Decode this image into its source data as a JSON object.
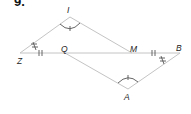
{
  "problem": {
    "number": "9."
  },
  "points": {
    "I": {
      "label": "I",
      "x": 70,
      "y": 17
    },
    "Z": {
      "label": "Z",
      "x": 20,
      "y": 53
    },
    "Q": {
      "label": "Q",
      "x": 65,
      "y": 53
    },
    "M": {
      "label": "M",
      "x": 132,
      "y": 53
    },
    "B": {
      "label": "B",
      "x": 180,
      "y": 53
    },
    "A": {
      "label": "A",
      "x": 128,
      "y": 89
    }
  },
  "segments": [
    "ZI",
    "IM",
    "ZB",
    "QA",
    "AB"
  ],
  "markings": {
    "congruent_angles": [
      "I",
      "A"
    ],
    "double_tick_segments": [
      "ZQ",
      "MB"
    ],
    "angle_marks_double_cross": [
      "Z",
      "B"
    ]
  },
  "colors": {
    "line": "#c0c0c0",
    "mark": "#666666",
    "text": "#222222"
  }
}
